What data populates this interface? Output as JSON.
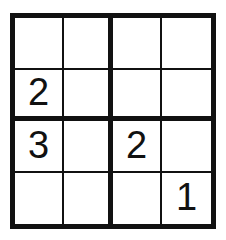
{
  "puzzle": {
    "type": "sudoku-4x4",
    "title": "4x4 Sudoku Grid",
    "size": 4,
    "box_rows": 2,
    "box_cols": 2,
    "colors": {
      "background": "#ffffff",
      "grid_line": "#111111",
      "digit": "#111111"
    },
    "line_widths": {
      "outer_border_px": 5,
      "box_divider_px": 5,
      "cell_divider_px": 2
    },
    "rows": [
      {
        "index": 1,
        "cells": [
          {
            "col": 1,
            "value": ""
          },
          {
            "col": 2,
            "value": ""
          },
          {
            "col": 3,
            "value": ""
          },
          {
            "col": 4,
            "value": ""
          }
        ]
      },
      {
        "index": 2,
        "cells": [
          {
            "col": 1,
            "value": "2"
          },
          {
            "col": 2,
            "value": ""
          },
          {
            "col": 3,
            "value": ""
          },
          {
            "col": 4,
            "value": ""
          }
        ]
      },
      {
        "index": 3,
        "cells": [
          {
            "col": 1,
            "value": "3"
          },
          {
            "col": 2,
            "value": ""
          },
          {
            "col": 3,
            "value": "2"
          },
          {
            "col": 4,
            "value": ""
          }
        ]
      },
      {
        "index": 4,
        "cells": [
          {
            "col": 1,
            "value": ""
          },
          {
            "col": 2,
            "value": ""
          },
          {
            "col": 3,
            "value": ""
          },
          {
            "col": 4,
            "value": "1"
          }
        ]
      }
    ]
  }
}
